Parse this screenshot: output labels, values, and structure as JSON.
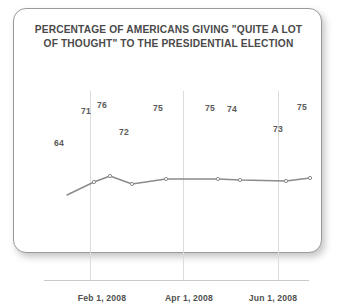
{
  "card": {
    "border_color": "#9a9a9a",
    "background": "#ffffff"
  },
  "title": {
    "line1": "PERCENTAGE OF AMERICANS GIVING \"QUITE A LOT",
    "line2": "OF THOUGHT\" TO THE PRESIDENTIAL ELECTION",
    "color": "#4a4a4a"
  },
  "chart_data": {
    "type": "line",
    "title": "PERCENTAGE OF AMERICANS GIVING \"QUITE A LOT OF THOUGHT\" TO THE PRESIDENTIAL ELECTION",
    "xlabel": "",
    "ylabel": "",
    "ylim": [
      60,
      80
    ],
    "grid": "vertical-only",
    "legend": "none",
    "series_color": "#8b8b8b",
    "marker": "circle-open",
    "values": [
      64,
      71,
      76,
      72,
      75,
      75,
      74,
      73,
      75
    ],
    "point_labels": [
      "64",
      "71",
      "76",
      "72",
      "75",
      "75",
      "74",
      "73",
      "75"
    ],
    "label_positions": [
      "below",
      "above",
      "above",
      "below",
      "above",
      "above",
      "above",
      "below",
      "above"
    ],
    "points_px": [
      {
        "x": 45,
        "y": 124
      },
      {
        "x": 72,
        "y": 111
      },
      {
        "x": 88,
        "y": 105
      },
      {
        "x": 110,
        "y": 113
      },
      {
        "x": 144,
        "y": 108
      },
      {
        "x": 196,
        "y": 108
      },
      {
        "x": 218,
        "y": 109
      },
      {
        "x": 264,
        "y": 110
      },
      {
        "x": 288,
        "y": 107
      }
    ],
    "gridlines_px": [
      76,
      169,
      264
    ],
    "axis_ticks": [
      {
        "label": "Feb 1, 2008",
        "x": 88
      },
      {
        "label": "Apr 1, 2008",
        "x": 175
      },
      {
        "label": "Jun 1, 2008",
        "x": 259
      }
    ],
    "tick_labels": [
      "Feb 1, 2008",
      "Apr 1, 2008",
      "Jun 1, 2008"
    ]
  }
}
